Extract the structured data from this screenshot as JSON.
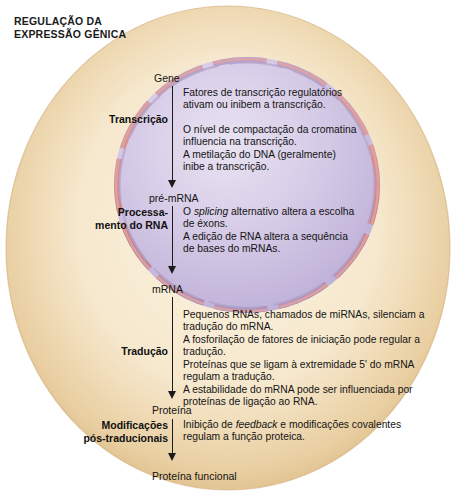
{
  "title": "REGULAÇÃO DA\nEXPRESSÃO GÊNICA",
  "colors": {
    "page_background": "#ffffff",
    "cell_outer_rim": "#dcb97f",
    "cell_cytoplasm": "#f7ead2",
    "nucleus_fill": "#d3c8e4",
    "nucleus_highlight": "#e7e0f0",
    "nuclear_membrane": "#cf8a8a",
    "nuclear_membrane_edge": "#9b8bbd",
    "text": "#141414"
  },
  "illustration": {
    "cell_name": "eukaryotic-cell",
    "nucleus_name": "nucleus",
    "membrane_name": "nuclear-membrane",
    "pore_count": 10
  },
  "flow": {
    "nodes": [
      {
        "id": "gene",
        "label": "Gene"
      },
      {
        "id": "pre-mrna",
        "label": "pré-mRNA"
      },
      {
        "id": "mrna",
        "label": "mRNA"
      },
      {
        "id": "proteina",
        "label": "Proteína"
      },
      {
        "id": "proteina-funcional",
        "label": "Proteína funcional"
      }
    ],
    "steps": [
      {
        "id": "transcricao",
        "stage_label": "Transcrição",
        "descriptions": [
          "Fatores de transcrição regulatórios\nativam ou inibem a transcrição.",
          "O nível de compactação da cromatina\ninfluencia na transcrição.",
          "A metilação do DNA (geralmente)\ninibe a transcrição."
        ]
      },
      {
        "id": "processamento-do-rna",
        "stage_label": "Processa-\nmento do RNA",
        "descriptions": [
          "O splicing alternativo altera a escolha\nde éxons.",
          "A edição de RNA altera a sequência\nde bases do mRNAs."
        ]
      },
      {
        "id": "traducao",
        "stage_label": "Tradução",
        "descriptions": [
          "Pequenos RNAs, chamados de miRNAs, silenciam a\ntradução do mRNA.",
          "A fosforilação de fatores de iniciação pode regular a\ntradução.",
          "Proteínas que se ligam à extremidade 5' do mRNA\nregulam a tradução.",
          "A estabilidade do mRNA pode ser influenciada por\nproteínas de ligação ao RNA."
        ]
      },
      {
        "id": "modificacoes-pos-traducionais",
        "stage_label": "Modificações\npós-traducionais",
        "descriptions": [
          "Inibição de feedback e modificações covalentes\nregulam a função proteica."
        ]
      }
    ]
  }
}
